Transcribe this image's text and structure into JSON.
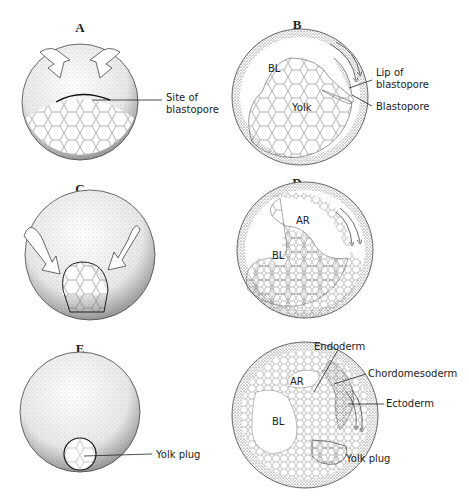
{
  "figure": {
    "panels": [
      {
        "id": "A",
        "labels": {
          "site": [
            "Site of",
            "blastopore"
          ]
        }
      },
      {
        "id": "B",
        "labels": {
          "bl": "BL",
          "yolk": "Yolk",
          "lip": [
            "Lip of",
            "blastopore"
          ],
          "blastopore": "Blastopore"
        }
      },
      {
        "id": "C",
        "labels": {}
      },
      {
        "id": "D",
        "labels": {
          "ar": "AR",
          "bl": "BL"
        }
      },
      {
        "id": "E",
        "labels": {
          "yolk_plug": "Yolk plug"
        }
      },
      {
        "id": "F",
        "labels": {
          "ar": "AR",
          "bl": "BL",
          "endoderm": "Endoderm",
          "chordomesoderm": "Chordomesoderm",
          "ectoderm": "Ectoderm",
          "yolk_plug": "Yolk plug"
        }
      }
    ]
  }
}
